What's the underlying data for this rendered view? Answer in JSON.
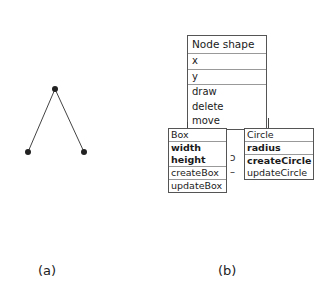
{
  "panel_a": {
    "caption": "(a)",
    "tree": {
      "nodes": [
        {
          "id": "root",
          "x": 55,
          "y": 89
        },
        {
          "id": "left",
          "x": 28,
          "y": 152
        },
        {
          "id": "right",
          "x": 84,
          "y": 152
        }
      ],
      "edges": [
        [
          "root",
          "left"
        ],
        [
          "root",
          "right"
        ]
      ]
    }
  },
  "panel_b": {
    "caption": "(b)",
    "node_shape": {
      "title": "Node shape",
      "attributes": [
        "x",
        "y"
      ],
      "methods": [
        "draw",
        "delete",
        "move"
      ]
    },
    "box": {
      "title": "Box",
      "attributes": [
        "width",
        "height"
      ],
      "methods": [
        "createBox",
        "updateBox"
      ]
    },
    "circle": {
      "title": "Circle",
      "attributes": [
        "radius"
      ],
      "methods": [
        "createCircle",
        "updateCircle"
      ]
    },
    "between_glyph_top": "ɔ",
    "between_glyph_bottom": "–"
  }
}
